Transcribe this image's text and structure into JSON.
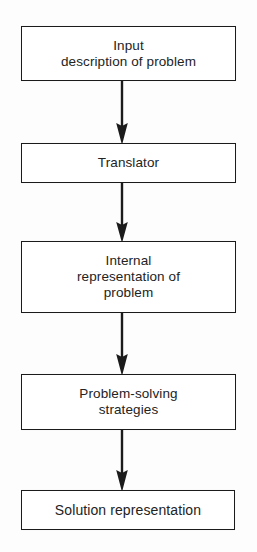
{
  "figure": {
    "type": "flowchart",
    "orientation": "vertical",
    "background_color": "#fdfdfd",
    "line_color": "#1b1b1b",
    "text_color": "#232323"
  },
  "nodes": [
    {
      "id": "input",
      "label": "Input\ndescription of problem",
      "shape": "rectangle"
    },
    {
      "id": "translator",
      "label": "Translator",
      "shape": "rectangle"
    },
    {
      "id": "internal",
      "label": "Internal\nrepresentation of\nproblem",
      "shape": "rectangle"
    },
    {
      "id": "strategies",
      "label": "Problem-solving\nstrategies",
      "shape": "rectangle"
    },
    {
      "id": "solution",
      "label": "Solution representation",
      "shape": "rectangle"
    }
  ],
  "connectors": [
    {
      "id": "arrow-1",
      "from": "input",
      "to": "translator",
      "style": "solid-down-arrow"
    },
    {
      "id": "arrow-2",
      "from": "translator",
      "to": "internal",
      "style": "solid-down-arrow"
    },
    {
      "id": "arrow-3",
      "from": "internal",
      "to": "strategies",
      "style": "solid-down-arrow"
    },
    {
      "id": "arrow-4",
      "from": "strategies",
      "to": "solution",
      "style": "solid-down-arrow"
    }
  ]
}
